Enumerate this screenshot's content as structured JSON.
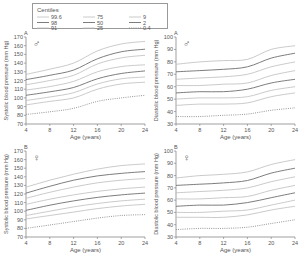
{
  "legend": {
    "title": "Centiles",
    "entries": [
      {
        "label": "99.6",
        "style": "light"
      },
      {
        "label": "98",
        "style": "dark"
      },
      {
        "label": "91",
        "style": "light"
      },
      {
        "label": "75",
        "style": "light"
      },
      {
        "label": "50",
        "style": "dark"
      },
      {
        "label": "25",
        "style": "light"
      },
      {
        "label": "9",
        "style": "light"
      },
      {
        "label": "2",
        "style": "dark"
      },
      {
        "label": "0.4",
        "style": "dotted"
      }
    ]
  },
  "colors": {
    "light": "#bdbdbd",
    "dark": "#6e6e6e",
    "dotted": "#8a8a8a",
    "axis": "#777777"
  },
  "chart_data": [
    {
      "type": "line",
      "panel": "A",
      "sex": "male",
      "symbol": "♂",
      "ylabel": "Systolic blood pressure (mm Hg)",
      "xlabel": "Age (years)",
      "x": [
        4,
        8,
        12,
        16,
        20,
        24
      ],
      "xticks": [
        "4",
        "8",
        "12",
        "16",
        "20",
        "24"
      ],
      "yticks": [
        "70",
        "80",
        "90",
        "100",
        "110",
        "120",
        "130",
        "140",
        "150",
        "160",
        "170"
      ],
      "ylim": [
        70,
        170
      ],
      "xlim": [
        4,
        24
      ],
      "series": [
        {
          "name": "99.6",
          "style": "light",
          "values": [
            127,
            133,
            140,
            154,
            162,
            165
          ]
        },
        {
          "name": "98",
          "style": "dark",
          "values": [
            121,
            126,
            132,
            145,
            153,
            156
          ]
        },
        {
          "name": "91",
          "style": "light",
          "values": [
            115,
            120,
            126,
            139,
            146,
            149
          ]
        },
        {
          "name": "75",
          "style": "light",
          "values": [
            109,
            113,
            119,
            130,
            136,
            138
          ]
        },
        {
          "name": "50",
          "style": "dark",
          "values": [
            103,
            107,
            112,
            122,
            128,
            131
          ]
        },
        {
          "name": "25",
          "style": "light",
          "values": [
            97,
            101,
            106,
            116,
            122,
            124
          ]
        },
        {
          "name": "9",
          "style": "light",
          "values": [
            92,
            96,
            100,
            110,
            116,
            118
          ]
        },
        {
          "name": "0.4",
          "style": "dotted",
          "values": [
            81,
            84,
            88,
            96,
            100,
            103
          ]
        }
      ]
    },
    {
      "type": "line",
      "panel": "A",
      "sex": "male",
      "symbol": "♂",
      "ylabel": "Diastolic blood pressure (mm Hg)",
      "xlabel": "Age (years)",
      "x": [
        4,
        8,
        12,
        16,
        20,
        24
      ],
      "xticks": [
        "4",
        "8",
        "12",
        "16",
        "20",
        "24"
      ],
      "yticks": [
        "30",
        "40",
        "50",
        "60",
        "70",
        "80",
        "90",
        "100"
      ],
      "ylim": [
        30,
        100
      ],
      "xlim": [
        4,
        24
      ],
      "series": [
        {
          "name": "99.6",
          "style": "light",
          "values": [
            78,
            80,
            81,
            82,
            90,
            93
          ]
        },
        {
          "name": "98",
          "style": "dark",
          "values": [
            72,
            73,
            74,
            76,
            83,
            87
          ]
        },
        {
          "name": "91",
          "style": "light",
          "values": [
            66,
            67,
            68,
            70,
            76,
            80
          ]
        },
        {
          "name": "75",
          "style": "light",
          "values": [
            61,
            61,
            62,
            63,
            69,
            73
          ]
        },
        {
          "name": "50",
          "style": "dark",
          "values": [
            55,
            56,
            56,
            58,
            63,
            66
          ]
        },
        {
          "name": "25",
          "style": "light",
          "values": [
            50,
            51,
            51,
            52,
            57,
            60
          ]
        },
        {
          "name": "9",
          "style": "light",
          "values": [
            45,
            46,
            46,
            47,
            52,
            55
          ]
        },
        {
          "name": "0.4",
          "style": "dotted",
          "values": [
            36,
            36,
            37,
            38,
            41,
            43
          ]
        }
      ]
    },
    {
      "type": "line",
      "panel": "B",
      "sex": "female",
      "symbol": "♀",
      "ylabel": "Systolic blood pressure (mm Hg)",
      "xlabel": "Age (years)",
      "x": [
        4,
        8,
        12,
        16,
        20,
        24
      ],
      "xticks": [
        "4",
        "8",
        "12",
        "16",
        "20",
        "24"
      ],
      "yticks": [
        "70",
        "80",
        "90",
        "100",
        "110",
        "120",
        "130",
        "140",
        "150",
        "160",
        "170"
      ],
      "ylim": [
        70,
        170
      ],
      "xlim": [
        4,
        24
      ],
      "series": [
        {
          "name": "99.6",
          "style": "light",
          "values": [
            128,
            136,
            143,
            149,
            153,
            155
          ]
        },
        {
          "name": "98",
          "style": "dark",
          "values": [
            121,
            129,
            136,
            141,
            144,
            146
          ]
        },
        {
          "name": "91",
          "style": "light",
          "values": [
            115,
            122,
            128,
            133,
            136,
            138
          ]
        },
        {
          "name": "75",
          "style": "light",
          "values": [
            108,
            114,
            119,
            123,
            126,
            128
          ]
        },
        {
          "name": "50",
          "style": "dark",
          "values": [
            101,
            107,
            112,
            116,
            119,
            121
          ]
        },
        {
          "name": "25",
          "style": "light",
          "values": [
            95,
            100,
            105,
            109,
            112,
            114
          ]
        },
        {
          "name": "9",
          "style": "light",
          "values": [
            91,
            95,
            99,
            103,
            106,
            108
          ]
        },
        {
          "name": "0.4",
          "style": "dotted",
          "values": [
            80,
            84,
            88,
            92,
            95,
            96
          ]
        }
      ]
    },
    {
      "type": "line",
      "panel": "B",
      "sex": "female",
      "symbol": "♀",
      "ylabel": "Diastolic blood pressure (mm Hg)",
      "xlabel": "Age (years)",
      "x": [
        4,
        8,
        12,
        16,
        20,
        24
      ],
      "xticks": [
        "4",
        "8",
        "12",
        "16",
        "20",
        "24"
      ],
      "yticks": [
        "30",
        "40",
        "50",
        "60",
        "70",
        "80",
        "90",
        "100"
      ],
      "ylim": [
        30,
        100
      ],
      "xlim": [
        4,
        24
      ],
      "series": [
        {
          "name": "99.6",
          "style": "light",
          "values": [
            78,
            80,
            81,
            83,
            89,
            93
          ]
        },
        {
          "name": "98",
          "style": "dark",
          "values": [
            72,
            73,
            74,
            76,
            82,
            86
          ]
        },
        {
          "name": "91",
          "style": "light",
          "values": [
            66,
            67,
            68,
            70,
            75,
            79
          ]
        },
        {
          "name": "75",
          "style": "light",
          "values": [
            61,
            61,
            62,
            63,
            68,
            72
          ]
        },
        {
          "name": "50",
          "style": "dark",
          "values": [
            55,
            56,
            56,
            58,
            62,
            66
          ]
        },
        {
          "name": "25",
          "style": "light",
          "values": [
            50,
            50,
            51,
            52,
            56,
            60
          ]
        },
        {
          "name": "9",
          "style": "light",
          "values": [
            46,
            46,
            46,
            48,
            52,
            55
          ]
        },
        {
          "name": "0.4",
          "style": "dotted",
          "values": [
            36,
            37,
            37,
            38,
            41,
            44
          ]
        }
      ]
    }
  ]
}
